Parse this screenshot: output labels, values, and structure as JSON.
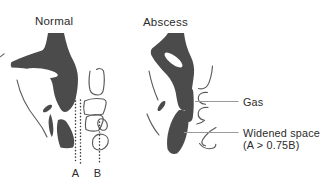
{
  "figure": {
    "colors": {
      "background": "#ffffff",
      "silhouette": "#4b4b4b",
      "outline": "#5a5a5a",
      "dotted": "#3a3a3a",
      "leader": "#9a9a9a",
      "text": "#2b2b2b"
    },
    "left_panel": {
      "title": "Normal",
      "label_a": "A",
      "label_b": "B"
    },
    "right_panel": {
      "title": "Abscess",
      "label_gas": "Gas",
      "label_widened_line1": "Widened space",
      "label_widened_line2": "(A > 0.75B)"
    }
  }
}
